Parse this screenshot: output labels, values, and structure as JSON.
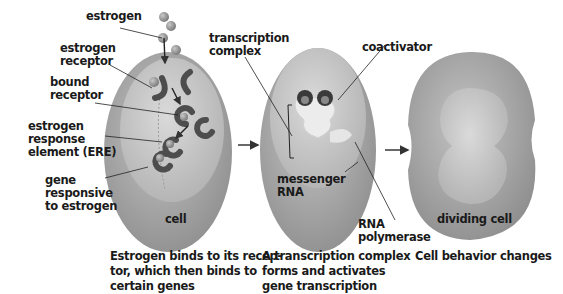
{
  "diagram": {
    "colors": {
      "cell_outer": "#a9a9a9",
      "cell_inner": "#c9c9c9",
      "receptor": "#555555",
      "estrogen": "#9a9a9a",
      "complex": "#ececec",
      "arrow": "#444444"
    },
    "panels": [
      {
        "cell_label": "cell",
        "labels": {
          "estrogen": "estrogen",
          "estrogen_receptor": [
            "estrogen",
            "receptor"
          ],
          "bound_receptor": [
            "bound",
            "receptor"
          ],
          "ere": [
            "estrogen",
            "response",
            "element (ERE)"
          ],
          "gene": [
            "gene",
            "responsive",
            "to estrogen"
          ]
        },
        "caption": [
          "Estrogen binds to its recep-",
          "tor, which then binds to",
          "certain genes"
        ]
      },
      {
        "labels": {
          "transcription_complex": [
            "transcription",
            "complex"
          ],
          "coactivator": "coactivator",
          "messenger_rna": [
            "messenger",
            "RNA"
          ],
          "rna_polymerase": [
            "RNA",
            "polymerase"
          ]
        },
        "caption": [
          "A transcription complex",
          "forms and activates",
          "gene transcription"
        ]
      },
      {
        "cell_label": "dividing cell",
        "caption": [
          "Cell behavior changes"
        ]
      }
    ]
  }
}
